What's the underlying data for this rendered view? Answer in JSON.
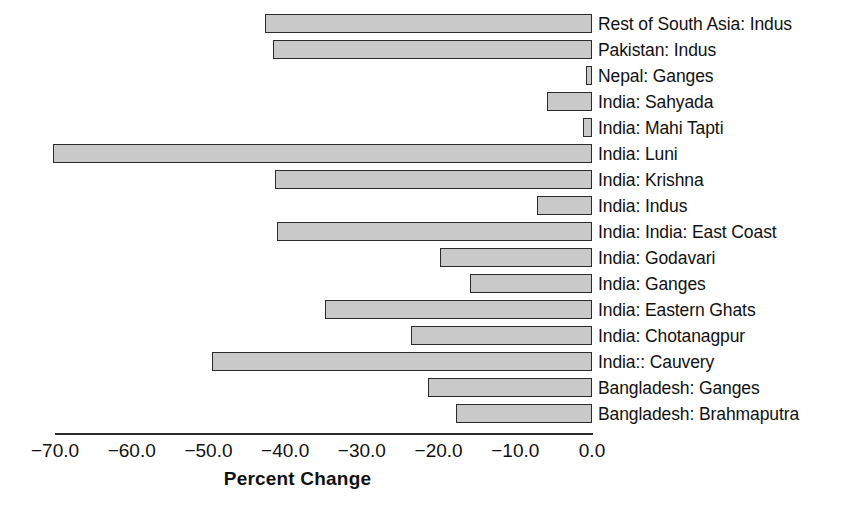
{
  "chart_data": {
    "type": "bar",
    "orientation": "horizontal",
    "title": "",
    "xlabel": "Percent Change",
    "ylabel": "",
    "xlim": [
      -70.0,
      0.0
    ],
    "xticks": [
      -70.0,
      -60.0,
      -50.0,
      -40.0,
      -30.0,
      -20.0,
      -10.0,
      0.0
    ],
    "xtick_labels": [
      "−70.0",
      "−60.0",
      "−50.0",
      "−40.0",
      "−30.0",
      "−20.0",
      "−10.0",
      "0.0"
    ],
    "grid": false,
    "legend": null,
    "bar_fill_color": "#c9c9c9",
    "bar_edge_color": "#2b2b2b",
    "categories": [
      "Rest of South Asia: Indus",
      "Pakistan: Indus",
      "Nepal: Ganges",
      "India: Sahyada",
      "India: Mahi Tapti",
      "India: Luni",
      "India: Krishna",
      "India: Indus",
      "India: India: East Coast",
      "India: Godavari",
      "India: Ganges",
      "India: Eastern Ghats",
      "India: Chotanagpur",
      "India:: Cauvery",
      "Bangladesh: Ganges",
      "Bangladesh: Brahmaputra"
    ],
    "values": [
      -42.6,
      -41.6,
      -0.8,
      -5.9,
      -1.2,
      -70.3,
      -41.3,
      -7.2,
      -41.1,
      -19.8,
      -15.9,
      -34.8,
      -23.6,
      -49.5,
      -21.4,
      -17.7
    ]
  },
  "axis": {
    "x_title": "Percent Change"
  }
}
